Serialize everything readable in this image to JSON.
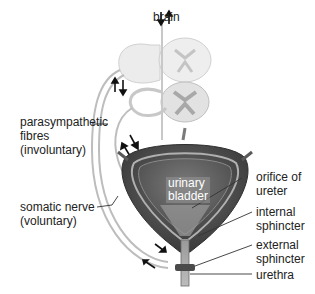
{
  "diagram": {
    "labels": {
      "brain": "brain",
      "parasympathetic": "parasympathetic\nfibres\n(involuntary)",
      "somatic": "somatic nerve\n(voluntary)",
      "bladder": "urinary\nbladder",
      "orifice": "orifice of\nureter",
      "internal": "internal\nsphincter",
      "external": "external\nsphincter",
      "urethra": "urethra"
    },
    "colors": {
      "bladder_outer": "#4a4a4a",
      "bladder_inner": "#6b6b6b",
      "nerve_line": "#b5b5b5",
      "spinal_cord": "#d6d6d6",
      "label_line": "#333333"
    }
  }
}
